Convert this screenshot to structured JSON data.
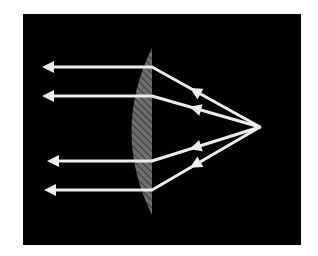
{
  "diagram": {
    "title": "",
    "colors": {
      "background": "#ffffff",
      "frame": "#000000",
      "ray": "#ececec",
      "lens_fill": "#6e6e6e",
      "lens_hatch": "#2a2a2a"
    },
    "source_point": {
      "x": 260,
      "y": 127
    },
    "lens": {
      "flat_x": 152,
      "top_y": 48,
      "bottom_y": 215,
      "bulge_x": 125
    },
    "rays": [
      {
        "id": "ray-1",
        "lens_y": 67,
        "exit_x": 42
      },
      {
        "id": "ray-2",
        "lens_y": 96,
        "exit_x": 42
      },
      {
        "id": "ray-3",
        "lens_y": 161,
        "exit_x": 47
      },
      {
        "id": "ray-4",
        "lens_y": 190,
        "exit_x": 44
      }
    ]
  }
}
